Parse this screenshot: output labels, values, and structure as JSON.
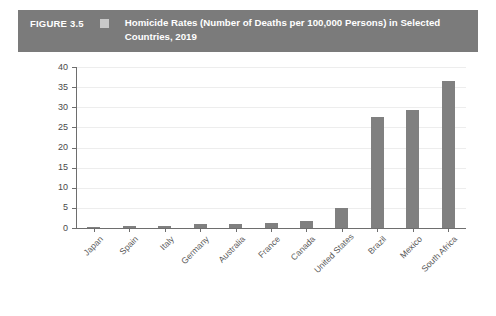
{
  "header": {
    "figure_label": "FIGURE 3.5",
    "legend_swatch": "legend-square",
    "title": "Homicide Rates (Number of Deaths per 100,000 Persons) in Selected Countries, 2019",
    "background_color": "#7b7b7b",
    "text_color": "#ffffff",
    "swatch_color": "#c9c9c9"
  },
  "chart_data": {
    "type": "bar",
    "title": "Homicide Rates (Number of Deaths per 100,000 Persons) in Selected Countries, 2019",
    "xlabel": "",
    "ylabel": "",
    "categories": [
      "Japan",
      "Spain",
      "Italy",
      "Germany",
      "Australia",
      "France",
      "Canada",
      "United States",
      "Brazil",
      "Mexico",
      "South Africa"
    ],
    "values": [
      0.3,
      0.6,
      0.6,
      0.9,
      0.9,
      1.2,
      1.8,
      5.0,
      27.5,
      29.2,
      36.5
    ],
    "ylim": [
      0,
      40
    ],
    "yticks": [
      0,
      5,
      10,
      15,
      20,
      25,
      30,
      35,
      40
    ],
    "ytick_labels": [
      "0",
      "5",
      "10",
      "15",
      "20",
      "25",
      "30",
      "35",
      "40"
    ],
    "grid": true,
    "legend": false,
    "bar_color": "#808080",
    "gridline_color": "#ededed",
    "axis_color": "#6e6e6e"
  }
}
